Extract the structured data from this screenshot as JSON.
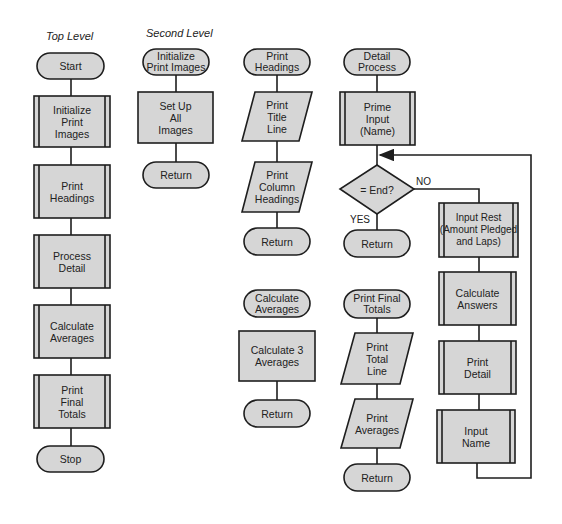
{
  "headers": {
    "top_level": "Top Level",
    "second_level": "Second Level"
  },
  "colors": {
    "fill": "#d6d6d6",
    "stroke": "#1e1e1e",
    "background": "#ffffff"
  },
  "top_level": {
    "start": "Start",
    "steps": [
      "Initialize\nPrint\nImages",
      "Print\nHeadings",
      "Process\nDetail",
      "Calculate\nAverages",
      "Print\nFinal\nTotals"
    ],
    "stop": "Stop"
  },
  "init_images": {
    "entry": "Initialize\nPrint Images",
    "process": "Set Up\nAll\nImages",
    "exit": "Return"
  },
  "print_headings": {
    "entry": "Print\nHeadings",
    "io1": "Print\nTitle\nLine",
    "io2": "Print\nColumn\nHeadings",
    "exit": "Return"
  },
  "calc_averages": {
    "entry": "Calculate\nAverages",
    "process": "Calculate 3\nAverages",
    "exit": "Return"
  },
  "detail_process": {
    "entry": "Detail\nProcess",
    "prime": "Prime\nInput\n(Name)",
    "decision": "= End?",
    "yes_label": "YES",
    "no_label": "NO",
    "exit": "Return",
    "loop": [
      "Input Rest\n(Amount Pledged\nand Laps)",
      "Calculate\nAnswers",
      "Print\nDetail",
      "Input\nName"
    ]
  },
  "print_final": {
    "entry": "Print Final\nTotals",
    "io1": "Print\nTotal\nLine",
    "io2": "Print\nAverages",
    "exit": "Return"
  }
}
